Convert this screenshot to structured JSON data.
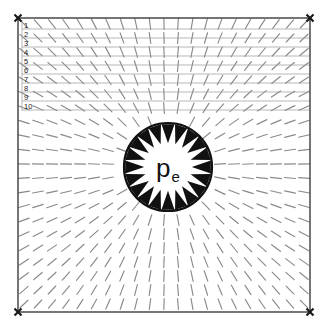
{
  "figure": {
    "title": "Radially converging vector field around central source region",
    "background_color": "#ffffff"
  },
  "chart_data": {
    "type": "scatter",
    "subtype": "vector-field-quiver",
    "title": "",
    "xlabel": "",
    "ylabel": "",
    "grid": true,
    "legend_position": "none",
    "axis_ranges": {
      "x": [
        18,
        310
      ],
      "y": [
        18,
        312
      ]
    },
    "frame": {
      "x0": 18,
      "y0": 18,
      "x1": 310,
      "y1": 312,
      "border_color": "#3c3c3c",
      "border_width": 1.4,
      "corner_marker": "x-cross",
      "corner_marker_color": "#1a1a1a",
      "corner_marker_size": 7
    },
    "gridlines": {
      "orientation": "horizontal",
      "color": "#9a9a9a",
      "width": 0.7,
      "label_color": "#1a1a1a",
      "label_font_size": 7.5,
      "x_start": 22,
      "x_end": 310,
      "label_x": 24,
      "rows": [
        {
          "label": "1",
          "y": 29
        },
        {
          "label": "2",
          "y": 38
        },
        {
          "label": "3",
          "y": 47
        },
        {
          "label": "4",
          "y": 56
        },
        {
          "label": "5",
          "y": 65
        },
        {
          "label": "6",
          "y": 74
        },
        {
          "label": "7",
          "y": 83
        },
        {
          "label": "8",
          "y": 92
        },
        {
          "label": "9",
          "y": 101
        },
        {
          "label": "10",
          "y": 110
        }
      ]
    },
    "source_region": {
      "label": "p",
      "label_subscript": "e",
      "label_full": "pe",
      "label_font_size": 26,
      "subscript_font_size": 15,
      "center_x": 168,
      "center_y": 167,
      "radius": 44,
      "circle_color": "#111111",
      "circle_width": 2.2,
      "fill_color": "#ffffff",
      "boundary_arrow_count": 20,
      "boundary_arrow_direction": "inward",
      "boundary_arrow_length": 19,
      "boundary_arrow_half_width": 6.5,
      "boundary_arrow_color": "#111111"
    },
    "field": {
      "description": "Field vectors converge radially inward toward the central source region",
      "direction": "inward",
      "glyph": "line-segment",
      "color": "#8a8a8a",
      "width": 1.15,
      "segment_length": 11,
      "spacing_x": 14,
      "spacing_y": 14,
      "origin_x": 168,
      "origin_y": 167,
      "exclusion_radius": 48,
      "x_start": 24,
      "x_end": 306,
      "y_start": 24,
      "y_end": 308
    }
  }
}
